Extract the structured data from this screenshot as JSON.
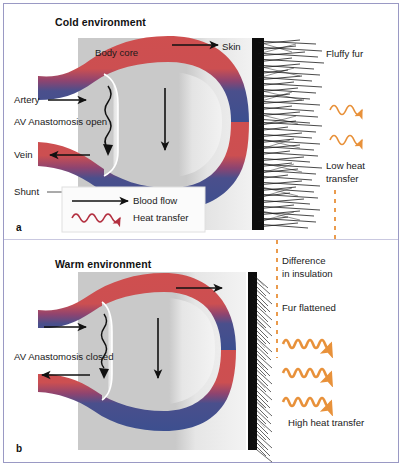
{
  "figure": {
    "border_color": "#9a99c4",
    "background": "#ffffff"
  },
  "colors": {
    "artery": "#c8ララ",
    "artery_red": "#cf4f4f",
    "vein_blue": "#3c4f8f",
    "body_core_gray": "#c9c9c9",
    "skin_gray": "#efefef",
    "fur_black": "#111111",
    "heat_orange": "#e8913a",
    "heat_red": "#b33040",
    "arrow_black": "#111111"
  },
  "panels": [
    {
      "id": "a",
      "letter": "a",
      "title": "Cold environment",
      "region_labels": {
        "body_core": "Body core",
        "skin": "Skin"
      },
      "vessel_labels": [
        {
          "name": "artery",
          "text": "Artery"
        },
        {
          "name": "anastomosis",
          "text": "AV Anastomosis open"
        },
        {
          "name": "vein",
          "text": "Vein"
        },
        {
          "name": "shunt",
          "text": "Shunt"
        }
      ],
      "fur_label": "Fluffy fur",
      "heat_label": "Low heat\ntransfer",
      "heat_label_line1": "Low heat",
      "heat_label_line2": "transfer",
      "heat_arrow_count": 2,
      "fur_state": "fluffy",
      "legend": {
        "items": [
          {
            "name": "blood-flow",
            "label": "Blood flow",
            "symbol": "straight-arrow",
            "color": "#111111"
          },
          {
            "name": "heat-transfer",
            "label": "Heat transfer",
            "symbol": "wavy-arrow",
            "color": "#b33040"
          }
        ]
      }
    },
    {
      "id": "b",
      "letter": "b",
      "title": "Warm environment",
      "vessel_labels": [
        {
          "name": "anastomosis",
          "text": "AV Anastomosis closed"
        }
      ],
      "insulation_label_line1": "Difference",
      "insulation_label_line2": "in insulation",
      "fur_label": "Fur flattened",
      "heat_label": "High heat transfer",
      "heat_arrow_count": 3,
      "fur_state": "flattened"
    }
  ]
}
